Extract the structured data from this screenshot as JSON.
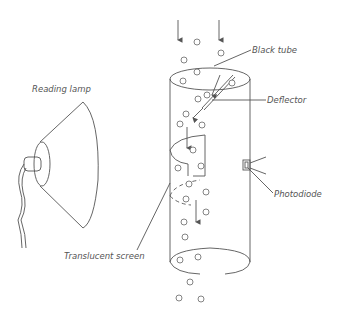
{
  "diagram": {
    "labels": {
      "reading_lamp": "Reading lamp",
      "black_tube": "Black tube",
      "deflector": "Deflector",
      "photodiode": "Photodiode",
      "translucent_screen": "Translucent screen"
    },
    "colors": {
      "line": "#555555",
      "background": "#ffffff"
    }
  }
}
